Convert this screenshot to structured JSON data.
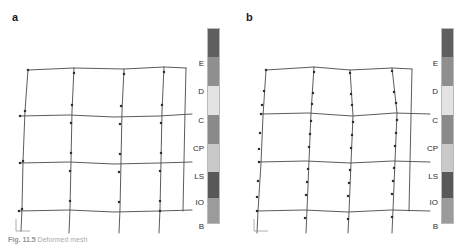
{
  "figure": {
    "caption_bold": "Fig. 11.5",
    "caption_text": "Deformed mesh"
  },
  "panels": [
    {
      "label": "a",
      "label_x": 12,
      "label_y": 12,
      "mesh": {
        "x": 8,
        "y": 55,
        "w": 180,
        "h": 175,
        "scale_marker": "axis-triad",
        "h_lines": [
          {
            "pts": "14,9 60,7 110,8 150,6 172,7"
          },
          {
            "pts": "6,55 55,54 100,56 145,55 178,53"
          },
          {
            "pts": "6,102 55,101 100,103 145,102 178,101"
          },
          {
            "pts": "5,150 55,149 100,151 145,150 178,149"
          }
        ],
        "v_lines": [
          {
            "pts": "14,9 11,50 9,100 8,148 7,170"
          },
          {
            "pts": "60,7 58,50 57,100 56,148 55,172"
          },
          {
            "pts": "110,8 108,50 107,100 106,148 105,172"
          },
          {
            "pts": "150,6 148,50 147,100 146,148 145,172"
          },
          {
            "pts": "172,7 171,50 170,100 169,150"
          }
        ],
        "nodes": [
          [
            14,
            9
          ],
          [
            60,
            12
          ],
          [
            110,
            13
          ],
          [
            150,
            11
          ],
          [
            11,
            50
          ],
          [
            58,
            44
          ],
          [
            107,
            45
          ],
          [
            148,
            44
          ],
          [
            6,
            55
          ],
          [
            57,
            62
          ],
          [
            106,
            63
          ],
          [
            147,
            62
          ],
          [
            9,
            100
          ],
          [
            57,
            92
          ],
          [
            106,
            93
          ],
          [
            147,
            92
          ],
          [
            6,
            102
          ],
          [
            56,
            110
          ],
          [
            105,
            111
          ],
          [
            146,
            110
          ],
          [
            8,
            148
          ],
          [
            56,
            140
          ],
          [
            105,
            141
          ],
          [
            146,
            140
          ],
          [
            5,
            150
          ],
          [
            146,
            150
          ]
        ]
      },
      "colorbar": {
        "x": 207,
        "labels_x": 182,
        "segments": [
          {
            "color": "#5f5f5f",
            "height": 28
          },
          {
            "color": "#8f8f8f",
            "height": 29
          },
          {
            "color": "#e3e3e3",
            "height": 29
          },
          {
            "color": "#8a8a8a",
            "height": 29
          },
          {
            "color": "#c9c9c9",
            "height": 28
          },
          {
            "color": "#585858",
            "height": 26
          },
          {
            "color": "#9b9b9b",
            "height": 27
          }
        ],
        "labels": [
          {
            "text": "E",
            "y": 36
          },
          {
            "text": "D",
            "y": 64
          },
          {
            "text": "C",
            "y": 93
          },
          {
            "text": "CP",
            "y": 121
          },
          {
            "text": "LS",
            "y": 149
          },
          {
            "text": "IO",
            "y": 175
          },
          {
            "text": "B",
            "y": 199
          }
        ]
      }
    },
    {
      "label": "b",
      "label_x": 12,
      "label_y": 12,
      "mesh": {
        "x": 12,
        "y": 55,
        "w": 180,
        "h": 175,
        "scale_marker": "axis-triad",
        "h_lines": [
          {
            "pts": "14,9 62,6 98,9 140,7 160,8"
          },
          {
            "pts": "9,53 56,52 100,55 143,52 178,53"
          },
          {
            "pts": "7,101 54,100 98,102 141,100 178,101"
          },
          {
            "pts": "5,150 52,149 96,151 139,149 178,150"
          }
        ],
        "v_lines": [
          {
            "pts": "14,9 11,55 9,102 6,150 5,172"
          },
          {
            "pts": "62,6 59,52 57,100 55,149 54,172"
          },
          {
            "pts": "98,9 101,55 99,102 97,151 96,172"
          },
          {
            "pts": "140,7 145,52 143,100 141,149 140,172"
          },
          {
            "pts": "160,8 159,55 158,102 157,150"
          }
        ],
        "nodes": [
          [
            14,
            9
          ],
          [
            62,
            11
          ],
          [
            98,
            12
          ],
          [
            140,
            10
          ],
          [
            12,
            30
          ],
          [
            61,
            32
          ],
          [
            99,
            33
          ],
          [
            142,
            31
          ],
          [
            10,
            44
          ],
          [
            60,
            43
          ],
          [
            100,
            44
          ],
          [
            144,
            42
          ],
          [
            9,
            53
          ],
          [
            59,
            60
          ],
          [
            101,
            61
          ],
          [
            145,
            59
          ],
          [
            8,
            72
          ],
          [
            58,
            73
          ],
          [
            100,
            74
          ],
          [
            144,
            72
          ],
          [
            7,
            88
          ],
          [
            57,
            86
          ],
          [
            99,
            87
          ],
          [
            143,
            85
          ],
          [
            7,
            101
          ],
          [
            56,
            108
          ],
          [
            98,
            109
          ],
          [
            142,
            107
          ],
          [
            6,
            120
          ],
          [
            55,
            121
          ],
          [
            97,
            122
          ],
          [
            141,
            120
          ],
          [
            5,
            136
          ],
          [
            54,
            134
          ],
          [
            96,
            135
          ],
          [
            140,
            133
          ],
          [
            5,
            150
          ],
          [
            53,
            157
          ],
          [
            96,
            158
          ],
          [
            140,
            156
          ]
        ]
      },
      "colorbar": {
        "x": 441,
        "labels_x": 416,
        "segments": [
          {
            "color": "#5f5f5f",
            "height": 28
          },
          {
            "color": "#8f8f8f",
            "height": 29
          },
          {
            "color": "#e3e3e3",
            "height": 29
          },
          {
            "color": "#8a8a8a",
            "height": 29
          },
          {
            "color": "#c9c9c9",
            "height": 28
          },
          {
            "color": "#585858",
            "height": 26
          },
          {
            "color": "#9b9b9b",
            "height": 27
          }
        ],
        "labels": [
          {
            "text": "E",
            "y": 36
          },
          {
            "text": "D",
            "y": 64
          },
          {
            "text": "C",
            "y": 93
          },
          {
            "text": "CP",
            "y": 121
          },
          {
            "text": "LS",
            "y": 149
          },
          {
            "text": "IO",
            "y": 175
          },
          {
            "text": "B",
            "y": 199
          }
        ]
      }
    }
  ],
  "colors": {
    "mesh_line": "#4a4a4a",
    "node": "#2e2e2e",
    "text": "#1a1a1a",
    "background": "#ffffff"
  }
}
